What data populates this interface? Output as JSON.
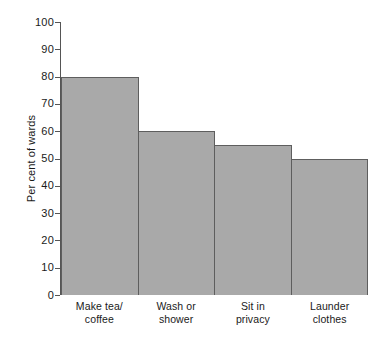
{
  "chart_data": {
    "type": "bar",
    "title": "",
    "subtitle": "",
    "xlabel": "",
    "ylabel": "Per cent of wards",
    "ylim": [
      0,
      100
    ],
    "yticks": [
      0,
      10,
      20,
      30,
      40,
      50,
      60,
      70,
      80,
      90,
      100
    ],
    "ytick_labels": [
      "0",
      "10",
      "20",
      "30",
      "40",
      "50",
      "60",
      "70",
      "80",
      "90",
      "100"
    ],
    "grid": false,
    "legend": null,
    "legend_position": "none",
    "bar_fill_color": "#a9a9a9",
    "bar_edge_color": "#5e5e5e",
    "axis_color": "#555555",
    "background_color": "#ffffff",
    "categories": [
      "Make tea/ coffee",
      "Wash or shower",
      "Sit in privacy",
      "Launder clothes"
    ],
    "category_lines": [
      [
        "Make tea/",
        "coffee"
      ],
      [
        "Wash or",
        "shower"
      ],
      [
        "Sit in",
        "privacy"
      ],
      [
        "Launder",
        "clothes"
      ]
    ],
    "values": [
      80,
      60,
      55,
      50
    ]
  }
}
